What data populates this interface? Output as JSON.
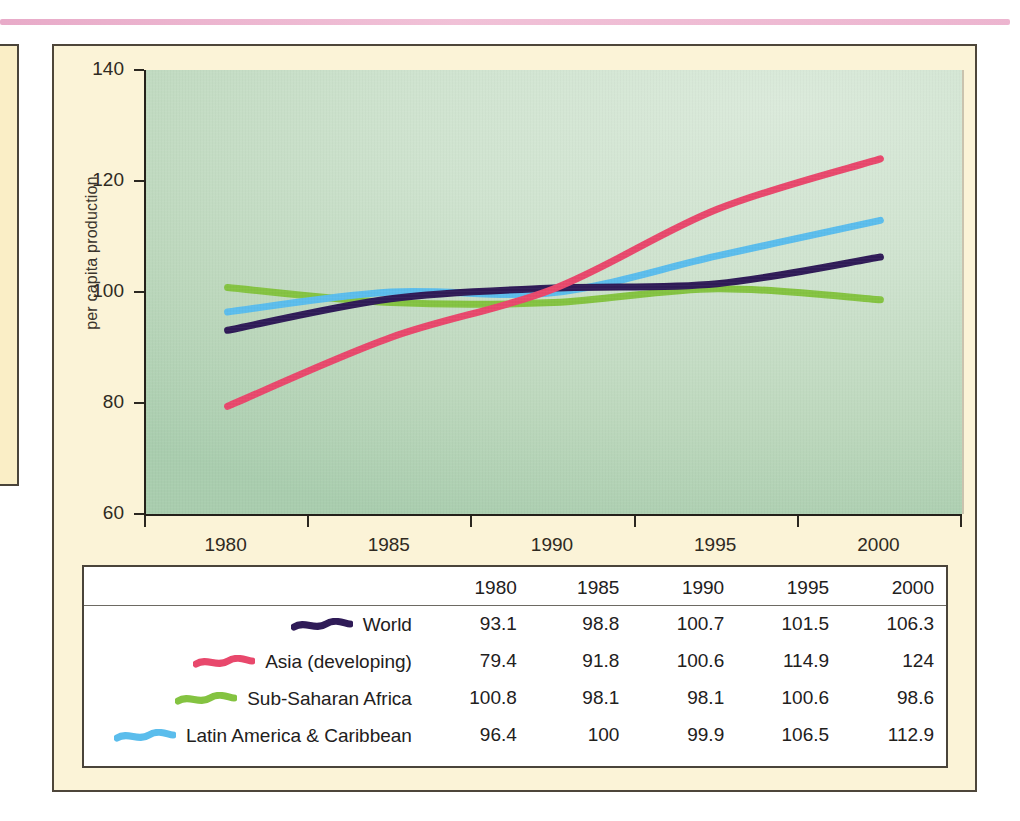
{
  "chart_data": {
    "type": "line",
    "title": "",
    "xlabel": "",
    "ylabel": "per capita production",
    "x": [
      1980,
      1985,
      1990,
      1995,
      2000
    ],
    "x_tick_labels": [
      "1980",
      "1985",
      "1990",
      "1995",
      "2000"
    ],
    "y_tick_labels": [
      "140",
      "120",
      "100",
      "80",
      "60"
    ],
    "y_ticks": [
      140,
      120,
      100,
      80,
      60
    ],
    "ylim": [
      60,
      140
    ],
    "xlim": [
      1980,
      2000
    ],
    "grid": false,
    "legend_position": "table-below",
    "series": [
      {
        "name": "World",
        "color": "#2f1b57",
        "values": [
          93.1,
          98.8,
          100.7,
          101.5,
          106.3
        ],
        "labels": [
          "93.1",
          "98.8",
          "100.7",
          "101.5",
          "106.3"
        ]
      },
      {
        "name": "Asia (developing)",
        "color": "#e8486c",
        "values": [
          79.4,
          91.8,
          100.6,
          114.9,
          124
        ],
        "labels": [
          "79.4",
          "91.8",
          "100.6",
          "114.9",
          "124"
        ]
      },
      {
        "name": "Sub-Saharan Africa",
        "color": "#84c341",
        "values": [
          100.8,
          98.1,
          98.1,
          100.6,
          98.6
        ],
        "labels": [
          "100.8",
          "98.1",
          "98.1",
          "100.6",
          "98.6"
        ]
      },
      {
        "name": "Latin America & Caribbean",
        "color": "#5bbdec",
        "values": [
          96.4,
          100,
          99.9,
          106.5,
          112.9
        ],
        "labels": [
          "96.4",
          "100",
          "99.9",
          "106.5",
          "112.9"
        ]
      }
    ]
  },
  "table": {
    "corner_header": "",
    "column_headers": [
      "1980",
      "1985",
      "1990",
      "1995",
      "2000"
    ],
    "rows": [
      {
        "series": "World",
        "color": "#2f1b57",
        "values": [
          "93.1",
          "98.8",
          "100.7",
          "101.5",
          "106.3"
        ]
      },
      {
        "series": "Asia (developing)",
        "color": "#e8486c",
        "values": [
          "79.4",
          "91.8",
          "100.6",
          "114.9",
          "124"
        ]
      },
      {
        "series": "Sub-Saharan Africa",
        "color": "#84c341",
        "values": [
          "100.8",
          "98.1",
          "98.1",
          "100.6",
          "98.6"
        ]
      },
      {
        "series": "Latin America & Caribbean",
        "color": "#5bbdec",
        "values": [
          "96.4",
          "100",
          "99.9",
          "106.5",
          "112.9"
        ]
      }
    ]
  },
  "colors": {
    "panel_background": "#fbf3d7",
    "plot_background_light": "#dbeadb",
    "plot_background_dark": "#a9cdae",
    "panel_border": "#4e463a",
    "rule": "#e8a9c6",
    "world": "#2f1b57",
    "asia_developing": "#e8486c",
    "sub_saharan_africa": "#84c341",
    "latin_america_caribbean": "#5bbdec"
  }
}
